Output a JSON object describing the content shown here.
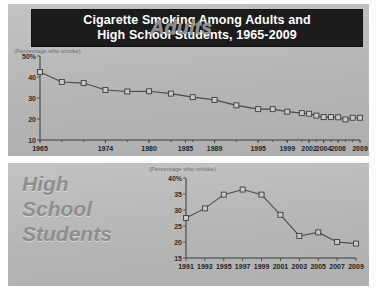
{
  "title": {
    "line1": "Cigarette Smoking Among Adults and",
    "line2": "High School Students, 1965-2009"
  },
  "colors": {
    "titlebar_bg": "#1c1c1c",
    "titlebar_text": "#ffffff",
    "panel_bg": "#b9b9b9",
    "line": "#4a4a4a",
    "marker_fill": "#c9c9c9",
    "watermark_text": "#8e8e8e"
  },
  "top_panel": {
    "axis_note": "(Percentage who smoke)",
    "watermark": "Adults"
  },
  "bottom_panel": {
    "axis_note": "(Percentage who smoke)",
    "watermark_line1": "High",
    "watermark_line2": "School",
    "watermark_line3": "Students"
  },
  "chart_data": [
    {
      "type": "line",
      "id": "adults",
      "title": "Adults",
      "xlabel": "",
      "ylabel": "(Percentage who smoke)",
      "ylim": [
        10,
        50
      ],
      "yticks": [
        10,
        20,
        30,
        40,
        50
      ],
      "ytick_labels": [
        "10",
        "20",
        "30",
        "40",
        "50%"
      ],
      "grid": false,
      "legend": "none",
      "xtick_labels": [
        "1965",
        "1974",
        "1980",
        "1985",
        "1989",
        "1995",
        "1999",
        "2002",
        "2004",
        "2006",
        "2009"
      ],
      "x": [
        1965,
        1968,
        1971,
        1974,
        1977,
        1980,
        1983,
        1986,
        1989,
        1992,
        1995,
        1997,
        1999,
        2001,
        2002,
        2003,
        2004,
        2005,
        2006,
        2007,
        2008,
        2009
      ],
      "values": [
        42.4,
        37.6,
        37.1,
        33.8,
        33.1,
        33.2,
        32.1,
        30.4,
        29.1,
        26.5,
        24.7,
        24.7,
        23.5,
        22.8,
        22.5,
        21.6,
        20.9,
        20.9,
        20.8,
        19.8,
        20.6,
        20.6
      ]
    },
    {
      "type": "line",
      "id": "high-school-students",
      "title": "High School Students",
      "xlabel": "",
      "ylabel": "(Percentage who smoke)",
      "ylim": [
        15,
        40
      ],
      "yticks": [
        15,
        20,
        25,
        30,
        35,
        40
      ],
      "ytick_labels": [
        "15",
        "20",
        "25",
        "30",
        "35",
        "40%"
      ],
      "grid": false,
      "legend": "none",
      "xtick_labels": [
        "1991",
        "1993",
        "1995",
        "1997",
        "1999",
        "2001",
        "2003",
        "2005",
        "2007",
        "2009"
      ],
      "x": [
        1991,
        1993,
        1995,
        1997,
        1999,
        2001,
        2003,
        2005,
        2007,
        2009
      ],
      "values": [
        27.5,
        30.5,
        34.8,
        36.4,
        34.8,
        28.5,
        21.9,
        23.0,
        20.0,
        19.5
      ]
    }
  ]
}
